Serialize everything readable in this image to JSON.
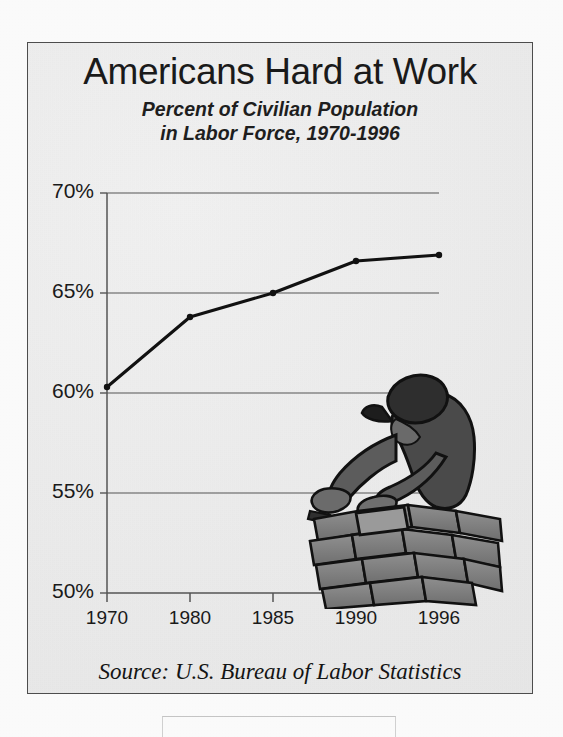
{
  "figure": {
    "title": "Americans Hard at Work",
    "subtitle_line1": "Percent of Civilian Population",
    "subtitle_line2": "in Labor Force, 1970-1996",
    "source": "Source:  U.S. Bureau of Labor Statistics",
    "illustration": "bricklayer-worker-illustration",
    "frame_color": "#4d4d4d",
    "background_color": "#efefef",
    "ink_color": "#1a1a1a"
  },
  "chart_data": {
    "type": "line",
    "title": "Americans Hard at Work",
    "subtitle": "Percent of Civilian Population in Labor Force, 1970-1996",
    "xlabel": "",
    "ylabel": "",
    "categories": [
      "1970",
      "1980",
      "1985",
      "1990",
      "1996"
    ],
    "values": [
      60.3,
      63.8,
      65.0,
      66.6,
      66.9
    ],
    "series": [
      {
        "name": "Percent of civilian population in labor force",
        "values": [
          60.3,
          63.8,
          65.0,
          66.6,
          66.9
        ]
      }
    ],
    "ylim": [
      50,
      70
    ],
    "yticks": [
      50,
      55,
      60,
      65,
      70
    ],
    "ytick_labels": [
      "50%",
      "55%",
      "60%",
      "65%",
      "70%"
    ],
    "xtick_labels": [
      "1970",
      "1980",
      "1985",
      "1990",
      "1996"
    ],
    "grid": true,
    "grid_axis": "y",
    "legend": false,
    "legend_position": "none",
    "markers": true,
    "line_color": "#111111",
    "source": "Source:  U.S. Bureau of Labor Statistics"
  },
  "bleed_through": {
    "ghost_text": ""
  }
}
